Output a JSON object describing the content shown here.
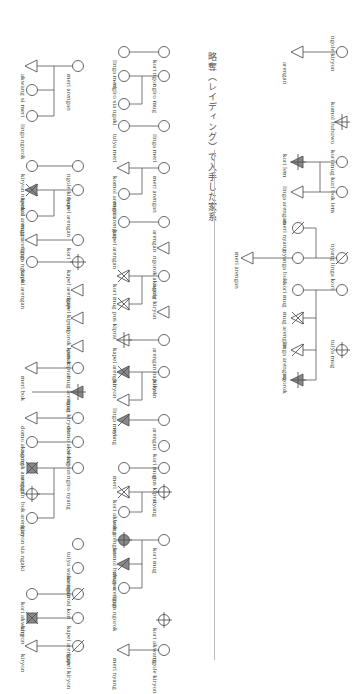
{
  "caption": "略奪（レイディング）で入手した家系",
  "colors": {
    "line": "#555555",
    "fill_dark": "#888888",
    "rule": "#bbbbbb"
  },
  "legend_symbols": {
    "circle": "female",
    "triangle": "male",
    "slashed": "deceased",
    "filled": "shaded individual",
    "crossed": "crossed-out individual"
  },
  "nodes": [
    {
      "shape": "circle",
      "x": 342,
      "y": 52
    },
    {
      "shape": "triangle",
      "x": 298,
      "y": 52
    },
    {
      "shape": "triangle-bar",
      "x": 342,
      "y": 122
    },
    {
      "shape": "circle",
      "x": 342,
      "y": 162
    },
    {
      "shape": "triangle-filled-bar",
      "x": 298,
      "y": 162
    },
    {
      "shape": "circle",
      "x": 342,
      "y": 192
    },
    {
      "shape": "triangle",
      "x": 298,
      "y": 192
    },
    {
      "shape": "circle-slash",
      "x": 298,
      "y": 228
    },
    {
      "shape": "circle-slash",
      "x": 342,
      "y": 258
    },
    {
      "shape": "circle",
      "x": 298,
      "y": 258
    },
    {
      "shape": "triangle",
      "x": 248,
      "y": 258
    },
    {
      "shape": "circle",
      "x": 342,
      "y": 290
    },
    {
      "shape": "circle",
      "x": 298,
      "y": 290
    },
    {
      "shape": "triangle-cross",
      "x": 298,
      "y": 318
    },
    {
      "shape": "circle-bar",
      "x": 342,
      "y": 350
    },
    {
      "shape": "triangle-arrow",
      "x": 298,
      "y": 350
    },
    {
      "shape": "triangle-filled-bar",
      "x": 298,
      "y": 380
    },
    {
      "shape": "circle",
      "x": 164,
      "y": 52
    },
    {
      "shape": "circle",
      "x": 124,
      "y": 52
    },
    {
      "shape": "circle",
      "x": 164,
      "y": 76
    },
    {
      "shape": "circle",
      "x": 124,
      "y": 76
    },
    {
      "shape": "circle",
      "x": 124,
      "y": 104
    },
    {
      "shape": "circle",
      "x": 164,
      "y": 126
    },
    {
      "shape": "circle",
      "x": 124,
      "y": 126
    },
    {
      "shape": "circle",
      "x": 164,
      "y": 168
    },
    {
      "shape": "triangle",
      "x": 124,
      "y": 168
    },
    {
      "shape": "circle",
      "x": 124,
      "y": 194
    },
    {
      "shape": "circle",
      "x": 164,
      "y": 222
    },
    {
      "shape": "circle",
      "x": 124,
      "y": 222
    },
    {
      "shape": "triangle",
      "x": 164,
      "y": 248
    },
    {
      "shape": "circle",
      "x": 164,
      "y": 276
    },
    {
      "shape": "triangle-cross",
      "x": 124,
      "y": 276
    },
    {
      "shape": "triangle-cross",
      "x": 124,
      "y": 304
    },
    {
      "shape": "triangle",
      "x": 164,
      "y": 312
    },
    {
      "shape": "circle",
      "x": 164,
      "y": 340
    },
    {
      "shape": "triangle-bar",
      "x": 124,
      "y": 340
    },
    {
      "shape": "circle",
      "x": 164,
      "y": 372
    },
    {
      "shape": "triangle-filled-cross",
      "x": 124,
      "y": 372
    },
    {
      "shape": "triangle",
      "x": 124,
      "y": 400
    },
    {
      "shape": "circle",
      "x": 164,
      "y": 420
    },
    {
      "shape": "triangle-filled-arrow",
      "x": 124,
      "y": 420
    },
    {
      "shape": "circle",
      "x": 164,
      "y": 446
    },
    {
      "shape": "circle",
      "x": 164,
      "y": 468
    },
    {
      "shape": "circle",
      "x": 124,
      "y": 468
    },
    {
      "shape": "circle-bar",
      "x": 164,
      "y": 492
    },
    {
      "shape": "triangle-cross",
      "x": 124,
      "y": 492
    },
    {
      "shape": "circle",
      "x": 124,
      "y": 512
    },
    {
      "shape": "circle",
      "x": 164,
      "y": 540
    },
    {
      "shape": "circle-filled-bar",
      "x": 124,
      "y": 540
    },
    {
      "shape": "triangle-filled-arrow",
      "x": 124,
      "y": 564
    },
    {
      "shape": "circle",
      "x": 124,
      "y": 588
    },
    {
      "shape": "circle-bar",
      "x": 164,
      "y": 620
    },
    {
      "shape": "circle",
      "x": 164,
      "y": 650
    },
    {
      "shape": "triangle",
      "x": 124,
      "y": 650
    },
    {
      "shape": "circle",
      "x": 78,
      "y": 66
    },
    {
      "shape": "triangle",
      "x": 32,
      "y": 66
    },
    {
      "shape": "circle",
      "x": 32,
      "y": 90
    },
    {
      "shape": "circle",
      "x": 32,
      "y": 116
    },
    {
      "shape": "circle",
      "x": 78,
      "y": 166
    },
    {
      "shape": "circle",
      "x": 32,
      "y": 166
    },
    {
      "shape": "circle",
      "x": 78,
      "y": 190
    },
    {
      "shape": "triangle-filled-cross",
      "x": 32,
      "y": 190
    },
    {
      "shape": "circle",
      "x": 32,
      "y": 216
    },
    {
      "shape": "circle",
      "x": 78,
      "y": 240
    },
    {
      "shape": "triangle",
      "x": 32,
      "y": 240
    },
    {
      "shape": "circle-bar",
      "x": 78,
      "y": 262
    },
    {
      "shape": "circle",
      "x": 32,
      "y": 262
    },
    {
      "shape": "triangle",
      "x": 78,
      "y": 290
    },
    {
      "shape": "triangle",
      "x": 78,
      "y": 318
    },
    {
      "shape": "triangle",
      "x": 78,
      "y": 346
    },
    {
      "shape": "circle",
      "x": 78,
      "y": 368
    },
    {
      "shape": "triangle",
      "x": 32,
      "y": 368
    },
    {
      "shape": "triangle-filled-bar",
      "x": 78,
      "y": 392
    },
    {
      "shape": "circle",
      "x": 78,
      "y": 418
    },
    {
      "shape": "triangle",
      "x": 32,
      "y": 418
    },
    {
      "shape": "circle",
      "x": 78,
      "y": 442
    },
    {
      "shape": "circle",
      "x": 32,
      "y": 442
    },
    {
      "shape": "circle",
      "x": 78,
      "y": 468
    },
    {
      "shape": "square-cross",
      "x": 32,
      "y": 468
    },
    {
      "shape": "circle-bar",
      "x": 32,
      "y": 494
    },
    {
      "shape": "circle",
      "x": 32,
      "y": 518
    },
    {
      "shape": "circle",
      "x": 78,
      "y": 544
    },
    {
      "shape": "circle",
      "x": 78,
      "y": 568
    },
    {
      "shape": "circle-slash",
      "x": 78,
      "y": 594
    },
    {
      "shape": "circle",
      "x": 32,
      "y": 594
    },
    {
      "shape": "circle",
      "x": 78,
      "y": 618
    },
    {
      "shape": "square-cross",
      "x": 32,
      "y": 618
    },
    {
      "shape": "circle-slash",
      "x": 78,
      "y": 646
    },
    {
      "shape": "triangle",
      "x": 32,
      "y": 646
    }
  ],
  "lines": [
    [
      342,
      52,
      320,
      52
    ],
    [
      320,
      52,
      320,
      52
    ],
    [
      320,
      52,
      298,
      52
    ],
    [
      342,
      162,
      320,
      162
    ],
    [
      342,
      192,
      320,
      192
    ],
    [
      320,
      162,
      320,
      192
    ],
    [
      320,
      162,
      298,
      162
    ],
    [
      320,
      192,
      298,
      192
    ],
    [
      298,
      228,
      316,
      228
    ],
    [
      316,
      228,
      316,
      258
    ],
    [
      342,
      258,
      316,
      258
    ],
    [
      298,
      258,
      316,
      258
    ],
    [
      298,
      258,
      270,
      258
    ],
    [
      270,
      258,
      248,
      258
    ],
    [
      342,
      290,
      316,
      290
    ],
    [
      298,
      290,
      316,
      290
    ],
    [
      316,
      290,
      316,
      380
    ],
    [
      316,
      318,
      298,
      318
    ],
    [
      316,
      350,
      298,
      350
    ],
    [
      316,
      380,
      298,
      380
    ],
    [
      164,
      52,
      124,
      52
    ],
    [
      164,
      76,
      142,
      76
    ],
    [
      124,
      76,
      142,
      76
    ],
    [
      142,
      76,
      142,
      104
    ],
    [
      142,
      104,
      124,
      104
    ],
    [
      164,
      126,
      124,
      126
    ],
    [
      164,
      168,
      142,
      168
    ],
    [
      142,
      168,
      124,
      168
    ],
    [
      142,
      168,
      142,
      194
    ],
    [
      142,
      194,
      124,
      194
    ],
    [
      164,
      222,
      124,
      222
    ],
    [
      164,
      276,
      142,
      276
    ],
    [
      142,
      276,
      124,
      276
    ],
    [
      142,
      276,
      142,
      304
    ],
    [
      142,
      304,
      124,
      304
    ],
    [
      164,
      340,
      124,
      340
    ],
    [
      164,
      372,
      142,
      372
    ],
    [
      142,
      372,
      124,
      372
    ],
    [
      142,
      372,
      142,
      400
    ],
    [
      142,
      400,
      124,
      400
    ],
    [
      164,
      420,
      124,
      420
    ],
    [
      164,
      468,
      124,
      468
    ],
    [
      164,
      492,
      142,
      492
    ],
    [
      142,
      492,
      124,
      492
    ],
    [
      142,
      492,
      142,
      512
    ],
    [
      142,
      512,
      124,
      512
    ],
    [
      164,
      540,
      142,
      540
    ],
    [
      142,
      540,
      124,
      540
    ],
    [
      142,
      540,
      142,
      588
    ],
    [
      142,
      564,
      124,
      564
    ],
    [
      142,
      588,
      124,
      588
    ],
    [
      164,
      650,
      124,
      650
    ],
    [
      78,
      66,
      54,
      66
    ],
    [
      54,
      66,
      32,
      66
    ],
    [
      54,
      66,
      54,
      116
    ],
    [
      54,
      90,
      32,
      90
    ],
    [
      54,
      116,
      32,
      116
    ],
    [
      78,
      166,
      32,
      166
    ],
    [
      78,
      190,
      54,
      190
    ],
    [
      54,
      190,
      32,
      190
    ],
    [
      54,
      190,
      54,
      216
    ],
    [
      54,
      216,
      32,
      216
    ],
    [
      78,
      240,
      32,
      240
    ],
    [
      78,
      262,
      54,
      262
    ],
    [
      54,
      262,
      32,
      262
    ],
    [
      78,
      368,
      32,
      368
    ],
    [
      78,
      392,
      54,
      392
    ],
    [
      54,
      392,
      32,
      392
    ],
    [
      78,
      418,
      32,
      418
    ],
    [
      78,
      442,
      54,
      442
    ],
    [
      54,
      442,
      32,
      442
    ],
    [
      78,
      468,
      54,
      468
    ],
    [
      54,
      468,
      32,
      468
    ],
    [
      54,
      468,
      54,
      518
    ],
    [
      54,
      494,
      32,
      494
    ],
    [
      54,
      518,
      32,
      518
    ],
    [
      78,
      594,
      54,
      594
    ],
    [
      54,
      594,
      32,
      594
    ],
    [
      78,
      618,
      32,
      618
    ],
    [
      78,
      646,
      32,
      646
    ]
  ],
  "labels": [
    {
      "text": "ngole kiryon",
      "x": 336,
      "y": 36
    },
    {
      "text": "arengan",
      "x": 288,
      "y": 62
    },
    {
      "text": "komol bubuwo",
      "x": 336,
      "y": 102
    },
    {
      "text": "kori mug kori bok lem",
      "x": 336,
      "y": 150
    },
    {
      "text": "kori lem",
      "x": 288,
      "y": 154
    },
    {
      "text": "linga arengan",
      "x": 288,
      "y": 186
    },
    {
      "text": "meri nyang",
      "x": 288,
      "y": 220
    },
    {
      "text": "nyang linga kori",
      "x": 336,
      "y": 244
    },
    {
      "text": "nyanga bok",
      "x": 288,
      "y": 250
    },
    {
      "text": "meri arengan",
      "x": 240,
      "y": 252
    },
    {
      "text": "kori mug",
      "x": 288,
      "y": 282
    },
    {
      "text": "mug arengan",
      "x": 288,
      "y": 312
    },
    {
      "text": "tulya mug",
      "x": 336,
      "y": 340
    },
    {
      "text": "linga arengan",
      "x": 288,
      "y": 342
    },
    {
      "text": "ngorok",
      "x": 288,
      "y": 374
    },
    {
      "text": "kori ngor",
      "x": 158,
      "y": 60
    },
    {
      "text": "linga meri",
      "x": 118,
      "y": 60
    },
    {
      "text": "ngiro mug",
      "x": 158,
      "y": 84
    },
    {
      "text": "ngiro sia ngaki",
      "x": 118,
      "y": 84
    },
    {
      "text": "linga meri",
      "x": 158,
      "y": 134
    },
    {
      "text": "tulya meri",
      "x": 118,
      "y": 134
    },
    {
      "text": "meri arengan",
      "x": 158,
      "y": 176
    },
    {
      "text": "komol arengan",
      "x": 118,
      "y": 176
    },
    {
      "text": "meri arengan",
      "x": 118,
      "y": 202
    },
    {
      "text": "arengan",
      "x": 158,
      "y": 230
    },
    {
      "text": "kapel arengan",
      "x": 118,
      "y": 230
    },
    {
      "text": "ngorok akwang",
      "x": 158,
      "y": 256
    },
    {
      "text": "ngole kiryon",
      "x": 158,
      "y": 284
    },
    {
      "text": "kori mug",
      "x": 118,
      "y": 284
    },
    {
      "text": "pus kiprat",
      "x": 118,
      "y": 312
    },
    {
      "text": "arengan napokol",
      "x": 158,
      "y": 348
    },
    {
      "text": "kapel arengan",
      "x": 118,
      "y": 348
    },
    {
      "text": "kiryon",
      "x": 158,
      "y": 380
    },
    {
      "text": "kiryon",
      "x": 118,
      "y": 380
    },
    {
      "text": "linga meri",
      "x": 118,
      "y": 408
    },
    {
      "text": "arengan",
      "x": 158,
      "y": 428
    },
    {
      "text": "nyang",
      "x": 118,
      "y": 428
    },
    {
      "text": "kori mug",
      "x": 158,
      "y": 454
    },
    {
      "text": "pus kiprat",
      "x": 158,
      "y": 476
    },
    {
      "text": "meri",
      "x": 118,
      "y": 476
    },
    {
      "text": "nyang",
      "x": 158,
      "y": 500
    },
    {
      "text": "kori akwang",
      "x": 118,
      "y": 500
    },
    {
      "text": "bok arengan",
      "x": 118,
      "y": 520
    },
    {
      "text": "kori mug",
      "x": 158,
      "y": 548
    },
    {
      "text": "komol bubuwo",
      "x": 118,
      "y": 548
    },
    {
      "text": "mug arengan",
      "x": 118,
      "y": 572
    },
    {
      "text": "linga ngorok",
      "x": 118,
      "y": 596
    },
    {
      "text": "kori akwang",
      "x": 158,
      "y": 628
    },
    {
      "text": "ngole kiryon",
      "x": 158,
      "y": 658
    },
    {
      "text": "meri nyang",
      "x": 118,
      "y": 658
    },
    {
      "text": "meri arengan",
      "x": 72,
      "y": 74
    },
    {
      "text": "akwang",
      "x": 26,
      "y": 74
    },
    {
      "text": "si meri",
      "x": 26,
      "y": 98
    },
    {
      "text": "linga ngorok",
      "x": 26,
      "y": 124
    },
    {
      "text": "ngole kiryon",
      "x": 72,
      "y": 174
    },
    {
      "text": "kiryon napokol",
      "x": 26,
      "y": 174
    },
    {
      "text": "kapel arengan",
      "x": 72,
      "y": 198
    },
    {
      "text": "komol arengan",
      "x": 26,
      "y": 198
    },
    {
      "text": "mug arengan",
      "x": 26,
      "y": 224
    },
    {
      "text": "kori",
      "x": 72,
      "y": 248
    },
    {
      "text": "linga ngorok",
      "x": 26,
      "y": 248
    },
    {
      "text": "kapel arengan",
      "x": 72,
      "y": 270
    },
    {
      "text": "kapel arengan",
      "x": 26,
      "y": 270
    },
    {
      "text": "kapel kiprat",
      "x": 72,
      "y": 298
    },
    {
      "text": "ngorok kamar",
      "x": 72,
      "y": 326
    },
    {
      "text": "pus kiprat",
      "x": 72,
      "y": 350
    },
    {
      "text": "mug arengan",
      "x": 72,
      "y": 376
    },
    {
      "text": "meri bok",
      "x": 26,
      "y": 376
    },
    {
      "text": "mug kiryon",
      "x": 72,
      "y": 400
    },
    {
      "text": "domo akwang",
      "x": 72,
      "y": 426
    },
    {
      "text": "domo akwang",
      "x": 26,
      "y": 426
    },
    {
      "text": "si kiryon",
      "x": 72,
      "y": 450
    },
    {
      "text": "ngorok arengan",
      "x": 26,
      "y": 450
    },
    {
      "text": "ngiro nyang",
      "x": 72,
      "y": 476
    },
    {
      "text": "arengan",
      "x": 26,
      "y": 476
    },
    {
      "text": "bok arengan",
      "x": 26,
      "y": 502
    },
    {
      "text": "kiryon sia ngaki",
      "x": 26,
      "y": 526
    },
    {
      "text": "tulya waka amuro",
      "x": 72,
      "y": 552
    },
    {
      "text": "arengan",
      "x": 72,
      "y": 576
    },
    {
      "text": "si kori",
      "x": 72,
      "y": 602
    },
    {
      "text": "kori akwang",
      "x": 26,
      "y": 602
    },
    {
      "text": "kapel arengan",
      "x": 72,
      "y": 626
    },
    {
      "text": "kiryon",
      "x": 26,
      "y": 626
    },
    {
      "text": "kapel kiryon",
      "x": 72,
      "y": 654
    },
    {
      "text": "kiryon",
      "x": 26,
      "y": 654
    }
  ]
}
